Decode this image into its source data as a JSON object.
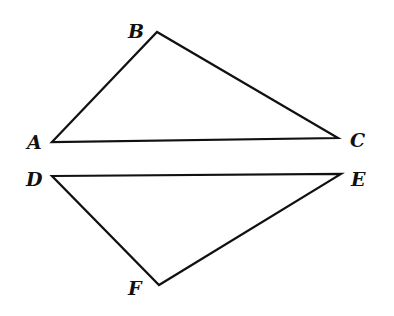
{
  "diagram": {
    "type": "geometry-figure",
    "triangles": [
      {
        "name": "ABC",
        "vertices": [
          {
            "label": "A",
            "x": 52,
            "y": 142
          },
          {
            "label": "B",
            "x": 157,
            "y": 32
          },
          {
            "label": "C",
            "x": 338,
            "y": 138
          }
        ]
      },
      {
        "name": "DEF",
        "vertices": [
          {
            "label": "D",
            "x": 52,
            "y": 176
          },
          {
            "label": "E",
            "x": 341,
            "y": 174
          },
          {
            "label": "F",
            "x": 159,
            "y": 285
          }
        ]
      }
    ],
    "labels": {
      "A": "A",
      "B": "B",
      "C": "C",
      "D": "D",
      "E": "E",
      "F": "F"
    },
    "colors": {
      "line": "#111111",
      "background": "#ffffff"
    }
  }
}
